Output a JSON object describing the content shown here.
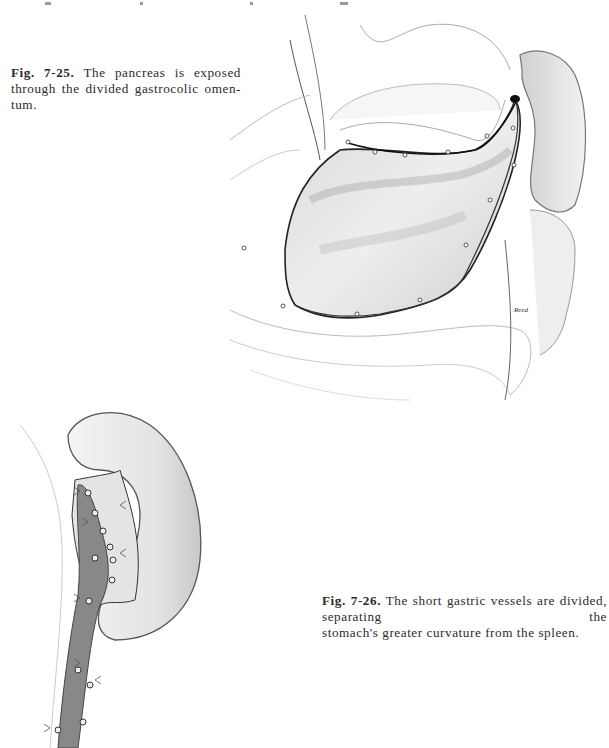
{
  "page": {
    "figures": [
      {
        "id": "fig-7-25",
        "label": "Fig. 7-25.",
        "caption_lines": [
          "The pancreas is exposed",
          "through the divided gastrocolic omen-",
          "tum."
        ],
        "caption": "The pancreas is exposed through the divided gastrocolic omentum.",
        "illustration": "pancreas-exposed-through-divided-gastrocolic-omentum",
        "artist_signature": "Reed"
      },
      {
        "id": "fig-7-26",
        "label": "Fig. 7-26.",
        "caption_lines": [
          "The short gastric vessels are divided, separating the",
          "stomach's greater curvature from the spleen."
        ],
        "caption": "The short gastric vessels are divided, separating the stomach's greater curvature from the spleen.",
        "illustration": "short-gastric-vessels-divided-spleen"
      }
    ],
    "colors": {
      "background": "#ffffff",
      "text": "#2a2a2a",
      "ink": "#1a1a1a",
      "shade": "#8a8a8a",
      "vessel": "#6b6b6b"
    }
  }
}
